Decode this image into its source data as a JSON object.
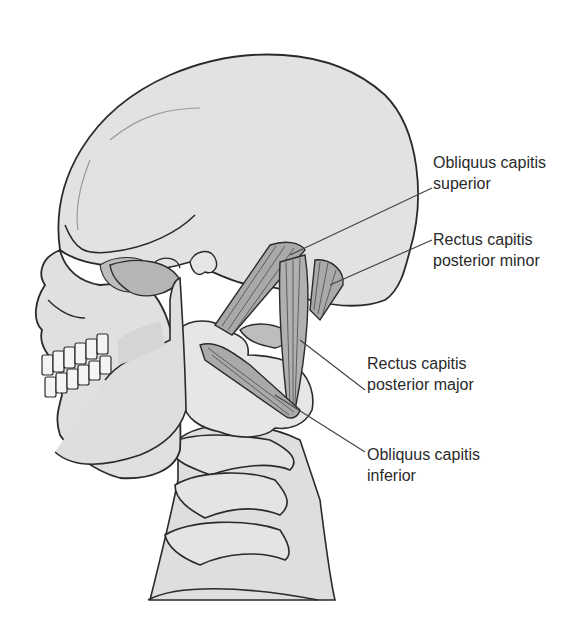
{
  "figure": {
    "colors": {
      "bone_fill": "#e2e2e2",
      "bone_shadow": "#c8c8c8",
      "outline": "#2a2a2a",
      "muscle_fill": "#a9a9a9",
      "muscle_striation": "#555555",
      "leader_line": "#444444",
      "label_text": "#2a2a2a",
      "background": "#ffffff"
    }
  },
  "labels": [
    {
      "id": "obliquus-capitis-superior",
      "line1": "Obliquus capitis",
      "line2": "superior"
    },
    {
      "id": "rectus-capitis-posterior-minor",
      "line1": "Rectus capitis",
      "line2": "posterior minor"
    },
    {
      "id": "rectus-capitis-posterior-major",
      "line1": "Rectus capitis",
      "line2": "posterior major"
    },
    {
      "id": "obliquus-capitis-inferior",
      "line1": "Obliquus capitis",
      "line2": "inferior"
    }
  ]
}
